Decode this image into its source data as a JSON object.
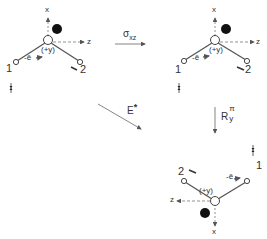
{
  "diagram": {
    "type": "symmetry-operation-diagram",
    "colors": {
      "line": "#555555",
      "ink": "#111111",
      "background": "#ffffff"
    },
    "operations": {
      "reflection": {
        "symbol": "σ",
        "subscript": "xz"
      },
      "inversion": {
        "symbol": "E",
        "superscript": "*"
      },
      "rotation": {
        "symbol": "R",
        "superscript": "π",
        "subscript": "y"
      }
    },
    "molecules": [
      {
        "id": "top-left",
        "axis_x": "x",
        "axis_z": "z",
        "center_label": "(+y)",
        "bond_label": "-ē",
        "atom_1": "1",
        "atom_2": "2"
      },
      {
        "id": "top-right",
        "axis_x": "x",
        "axis_z": "z",
        "center_label": "(+y)",
        "bond_label": "-ē",
        "atom_1": "1",
        "atom_2": "2"
      },
      {
        "id": "bottom-right",
        "axis_x": "x",
        "axis_z": "z",
        "center_label": "(+y)",
        "bond_label": "-ē",
        "atom_1": "1",
        "atom_2": "2"
      }
    ]
  }
}
